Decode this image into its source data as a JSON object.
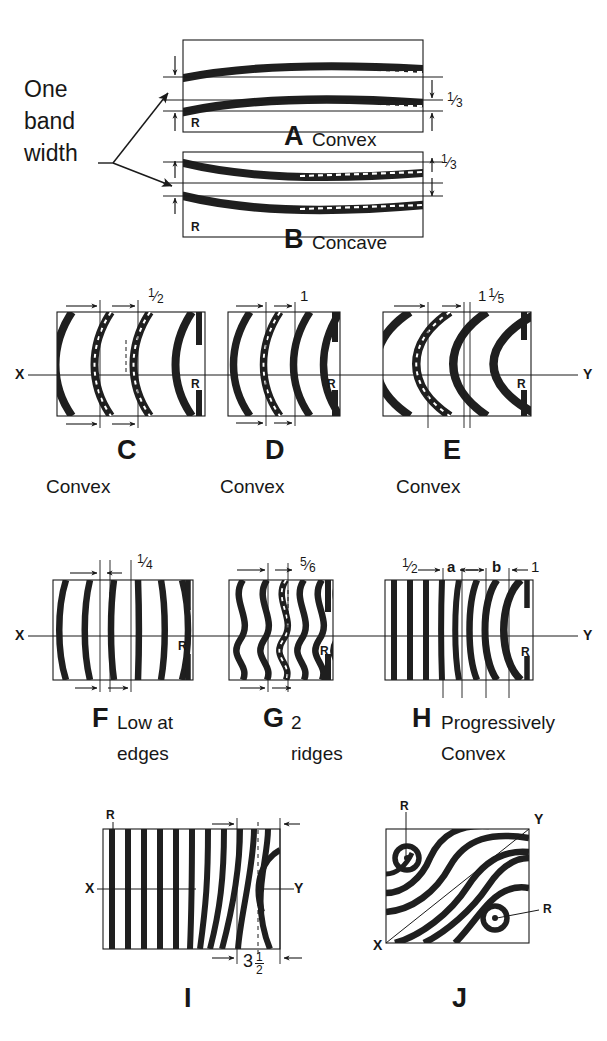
{
  "figure": {
    "ink_color": "#1a1a1a",
    "background": "#ffffff",
    "annotation_note": {
      "line1": "One",
      "line2": "band",
      "line3": "width"
    }
  },
  "panels": [
    {
      "id": "A",
      "letter": "A",
      "caption": "Convex",
      "ref_label": "R",
      "dimension_labels": [
        "1/3"
      ],
      "fringe_count": 2,
      "orientation": "horizontal",
      "curvature": "convex-up",
      "axis_labels": []
    },
    {
      "id": "B",
      "letter": "B",
      "caption": "Concave",
      "ref_label": "R",
      "dimension_labels": [
        "1/3"
      ],
      "fringe_count": 2,
      "orientation": "horizontal",
      "curvature": "concave-down",
      "axis_labels": []
    },
    {
      "id": "C",
      "letter": "C",
      "caption": "Convex",
      "ref_label": "R",
      "dimension_labels": [
        "1/2"
      ],
      "fringe_count": 4,
      "orientation": "vertical",
      "curvature": "convex-left",
      "axis_labels": [
        "X"
      ]
    },
    {
      "id": "D",
      "letter": "D",
      "caption": "Convex",
      "ref_label": "R",
      "dimension_labels": [
        "1"
      ],
      "fringe_count": 4,
      "orientation": "vertical",
      "curvature": "convex-left",
      "axis_labels": []
    },
    {
      "id": "E",
      "letter": "E",
      "caption": "Convex",
      "ref_label": "R",
      "dimension_labels": [
        "1 1/5"
      ],
      "fringe_count": 4,
      "orientation": "vertical",
      "curvature": "convex-left-strong",
      "axis_labels": [
        "Y"
      ]
    },
    {
      "id": "F",
      "letter": "F",
      "caption": "Low at edges",
      "caption_line1": "Low at",
      "caption_line2": "edges",
      "ref_label": "R",
      "dimension_labels": [
        "1/4"
      ],
      "fringe_count": 6,
      "orientation": "vertical",
      "curvature": "s-curve-slight",
      "axis_labels": [
        "X"
      ]
    },
    {
      "id": "G",
      "letter": "G",
      "caption": "2 ridges",
      "caption_line1": "2",
      "caption_line2": "ridges",
      "ref_label": "R",
      "dimension_labels": [
        "5/6"
      ],
      "fringe_count": 6,
      "orientation": "vertical",
      "curvature": "wavy-double-ridge",
      "axis_labels": []
    },
    {
      "id": "H",
      "letter": "H",
      "caption": "Progressively Convex",
      "caption_line1": "Progressively",
      "caption_line2": "Convex",
      "ref_label": "R",
      "dimension_labels": [
        "1/2",
        "a",
        "b",
        "1"
      ],
      "fringe_count": 9,
      "orientation": "vertical",
      "curvature": "progressive",
      "axis_labels": [
        "Y"
      ]
    },
    {
      "id": "I",
      "letter": "I",
      "caption": "",
      "ref_label": "R",
      "dimension_labels": [
        "3 1/2"
      ],
      "dimension_whole": "3",
      "dimension_num": "1",
      "dimension_den": "2",
      "fringe_count": 11,
      "orientation": "vertical",
      "curvature": "bend-right-edge",
      "axis_labels": [
        "X",
        "Y"
      ]
    },
    {
      "id": "J",
      "letter": "J",
      "caption": "",
      "ref_labels": [
        "R",
        "R"
      ],
      "dimension_labels": [],
      "fringe_count": 6,
      "orientation": "saddle",
      "curvature": "saddle-two-centers",
      "axis_labels": [
        "X",
        "Y"
      ]
    }
  ],
  "fractions": {
    "one_third": {
      "num": "1",
      "den": "3"
    },
    "one_half": {
      "num": "1",
      "den": "2"
    },
    "one": "1",
    "one_and_one_fifth_whole": "1",
    "one_and_one_fifth_num": "1",
    "one_and_one_fifth_den": "5",
    "one_quarter": {
      "num": "1",
      "den": "4"
    },
    "five_sixths": {
      "num": "5",
      "den": "6"
    },
    "label_a": "a",
    "label_b": "b",
    "three_and_half_whole": "3",
    "three_and_half_num": "1",
    "three_and_half_den": "2"
  },
  "axis_letters": {
    "x": "X",
    "y": "Y",
    "r": "R"
  }
}
